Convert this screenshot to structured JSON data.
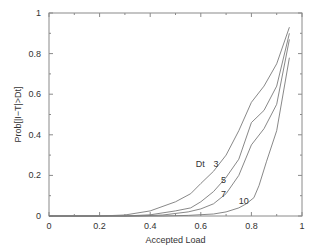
{
  "chart_data": {
    "type": "line",
    "title": "",
    "xlabel": "Accepted Load",
    "ylabel": "Prob[|I−T|>Dt]",
    "xlim": [
      0,
      1
    ],
    "ylim": [
      0,
      1
    ],
    "grid": false,
    "x_ticks": [
      0,
      0.2,
      0.4,
      0.6,
      0.8,
      1
    ],
    "x_tick_labels": [
      "0",
      "0.2",
      "0.4",
      "0.6",
      "0.8",
      "1"
    ],
    "y_ticks": [
      0,
      0.2,
      0.4,
      0.6,
      0.8,
      1
    ],
    "y_tick_labels": [
      "0",
      "0.2",
      "0.4",
      "0.6",
      "0.8",
      "1"
    ],
    "legend_title": "Dt",
    "series": [
      {
        "name": "3",
        "x": [
          0.2,
          0.3,
          0.4,
          0.5,
          0.56,
          0.6,
          0.65,
          0.7,
          0.75,
          0.8,
          0.85,
          0.9,
          0.95
        ],
        "y": [
          0.0,
          0.005,
          0.025,
          0.07,
          0.11,
          0.16,
          0.22,
          0.3,
          0.42,
          0.56,
          0.64,
          0.75,
          0.93
        ]
      },
      {
        "name": "5",
        "x": [
          0.3,
          0.4,
          0.5,
          0.56,
          0.6,
          0.65,
          0.7,
          0.75,
          0.8,
          0.85,
          0.9,
          0.95
        ],
        "y": [
          0.0,
          0.006,
          0.025,
          0.04,
          0.07,
          0.12,
          0.19,
          0.28,
          0.46,
          0.52,
          0.64,
          0.9
        ]
      },
      {
        "name": "7",
        "x": [
          0.35,
          0.45,
          0.55,
          0.6,
          0.65,
          0.7,
          0.75,
          0.8,
          0.85,
          0.9,
          0.95
        ],
        "y": [
          0.0,
          0.005,
          0.02,
          0.035,
          0.06,
          0.11,
          0.2,
          0.35,
          0.43,
          0.55,
          0.87
        ]
      },
      {
        "name": "10",
        "x": [
          0.45,
          0.55,
          0.65,
          0.7,
          0.75,
          0.78,
          0.81,
          0.83,
          0.86,
          0.9,
          0.95
        ],
        "y": [
          0.0,
          0.003,
          0.01,
          0.02,
          0.04,
          0.06,
          0.09,
          0.15,
          0.27,
          0.42,
          0.78
        ]
      }
    ],
    "annotations": [
      {
        "text": "Dt",
        "x": 0.58,
        "y": 0.24
      },
      {
        "text": "3",
        "x": 0.65,
        "y": 0.24
      },
      {
        "text": "5",
        "x": 0.68,
        "y": 0.165
      },
      {
        "text": "7",
        "x": 0.68,
        "y": 0.095
      },
      {
        "text": "10",
        "x": 0.75,
        "y": 0.06
      }
    ]
  }
}
